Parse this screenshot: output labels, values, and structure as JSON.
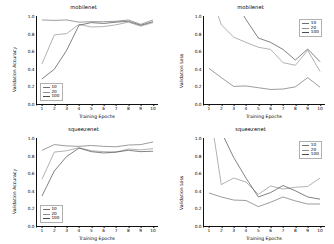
{
  "figure": {
    "background": "#ffffff",
    "grid_layout": "2x2"
  },
  "common": {
    "xlabel": "Training Epochs",
    "ylabel_accuracy": "Validation Accuracy",
    "ylabel_loss": "Validation Loss",
    "xticks": [
      "1",
      "2",
      "3",
      "4",
      "5",
      "6",
      "7",
      "8",
      "9",
      "10"
    ],
    "yticks_accuracy": [
      "1.0",
      "0.8",
      "0.6",
      "0.4",
      "0.2",
      "0.0"
    ],
    "yticks_loss": [
      "1.0",
      "0.8",
      "0.6",
      "0.4",
      "0.2",
      "0.0"
    ],
    "legend_labels": [
      "10",
      "20",
      "100"
    ],
    "colors": {
      "series_10": "#6f6f6f",
      "series_20": "#8f8f8f",
      "series_100": "#4a4a4a",
      "axis": "#111111"
    }
  },
  "chart_data": [
    {
      "id": "mobilenet-accuracy",
      "type": "line",
      "title": "mobilenet",
      "xlabel": "Training Epochs",
      "ylabel": "Validation Accuracy",
      "x": [
        1,
        2,
        3,
        4,
        5,
        6,
        7,
        8,
        9,
        10
      ],
      "xlim": [
        0.6,
        10.4
      ],
      "ylim": [
        0.0,
        1.0
      ],
      "grid": false,
      "legend_position": "lower left",
      "series": [
        {
          "name": "10",
          "values": [
            0.955,
            0.95,
            0.955,
            0.93,
            0.935,
            0.935,
            0.94,
            0.955,
            0.905,
            0.955
          ]
        },
        {
          "name": "20",
          "values": [
            0.455,
            0.785,
            0.8,
            0.905,
            0.875,
            0.88,
            0.9,
            0.93,
            0.885,
            0.925
          ]
        },
        {
          "name": "100",
          "values": [
            0.285,
            0.395,
            0.61,
            0.895,
            0.925,
            0.915,
            0.93,
            0.94,
            0.895,
            0.935
          ]
        }
      ]
    },
    {
      "id": "mobilenet-loss",
      "type": "line",
      "title": "mobilenet",
      "xlabel": "Training Epochs",
      "ylabel": "Validation Loss",
      "x": [
        1,
        2,
        3,
        4,
        5,
        6,
        7,
        8,
        9,
        10
      ],
      "xlim": [
        0.6,
        10.4
      ],
      "ylim": [
        0.0,
        1.0
      ],
      "grid": false,
      "legend_position": "upper right",
      "series": [
        {
          "name": "10",
          "values": [
            0.405,
            0.3,
            0.2,
            0.205,
            0.185,
            0.165,
            0.17,
            0.195,
            0.3,
            0.19
          ]
        },
        {
          "name": "20",
          "values": [
            1.31,
            0.9,
            0.76,
            0.7,
            0.645,
            0.62,
            0.47,
            0.44,
            0.61,
            0.37
          ]
        },
        {
          "name": "100",
          "values": [
            2.13,
            1.59,
            1.2,
            0.96,
            0.75,
            0.7,
            0.62,
            0.5,
            0.625,
            0.48
          ]
        }
      ]
    },
    {
      "id": "squeezenet-accuracy",
      "type": "line",
      "title": "squeezenet",
      "xlabel": "Training Epochs",
      "ylabel": "Validation Accuracy",
      "x": [
        1,
        2,
        3,
        4,
        5,
        6,
        7,
        8,
        9,
        10
      ],
      "xlim": [
        0.6,
        10.4
      ],
      "ylim": [
        0.0,
        1.0
      ],
      "grid": false,
      "legend_position": "lower left",
      "series": [
        {
          "name": "10",
          "values": [
            0.86,
            0.925,
            0.91,
            0.905,
            0.915,
            0.905,
            0.9,
            0.92,
            0.925,
            0.955
          ]
        },
        {
          "name": "20",
          "values": [
            0.53,
            0.84,
            0.855,
            0.89,
            0.855,
            0.845,
            0.84,
            0.875,
            0.865,
            0.88
          ]
        },
        {
          "name": "100",
          "values": [
            0.34,
            0.625,
            0.79,
            0.885,
            0.845,
            0.83,
            0.84,
            0.86,
            0.845,
            0.85
          ]
        }
      ]
    },
    {
      "id": "squeezenet-loss",
      "type": "line",
      "title": "squeezenet",
      "xlabel": "Training Epochs",
      "ylabel": "Validation Loss",
      "x": [
        1,
        2,
        3,
        4,
        5,
        6,
        7,
        8,
        9,
        10
      ],
      "xlim": [
        0.6,
        10.4
      ],
      "ylim": [
        0.0,
        1.0
      ],
      "grid": false,
      "legend_position": "upper right",
      "series": [
        {
          "name": "10",
          "values": [
            0.375,
            0.33,
            0.295,
            0.29,
            0.22,
            0.27,
            0.33,
            0.285,
            0.25,
            0.25
          ]
        },
        {
          "name": "20",
          "values": [
            1.39,
            0.47,
            0.545,
            0.5,
            0.36,
            0.455,
            0.42,
            0.44,
            0.45,
            0.545
          ]
        },
        {
          "name": "100",
          "values": [
            1.88,
            1.07,
            0.78,
            0.545,
            0.33,
            0.38,
            0.46,
            0.4,
            0.33,
            0.305
          ]
        }
      ]
    }
  ]
}
